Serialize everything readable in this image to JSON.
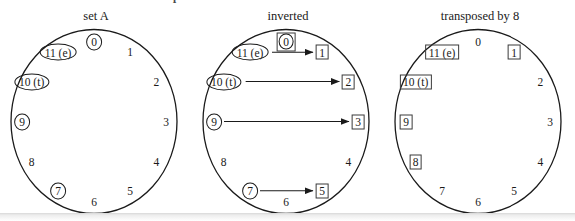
{
  "clipped_caption": "FIGURE 1.6. Pitch-class sets and operations",
  "colors": {
    "stroke": "#1a1a1a",
    "box_stroke": "#3a3a3a",
    "background": "#ffffff",
    "page_edge": "#e4e4e4"
  },
  "chart_data": {
    "type": "diagram",
    "title": "",
    "panels": [
      {
        "id": "set-a",
        "title": "set A",
        "clock_positions": [
          {
            "pc": 0,
            "label": "0",
            "angle_deg": 0,
            "marker": "ellipse"
          },
          {
            "pc": 1,
            "label": "1",
            "angle_deg": 30,
            "marker": "none"
          },
          {
            "pc": 2,
            "label": "2",
            "angle_deg": 60,
            "marker": "none"
          },
          {
            "pc": 3,
            "label": "3",
            "angle_deg": 90,
            "marker": "none"
          },
          {
            "pc": 4,
            "label": "4",
            "angle_deg": 120,
            "marker": "none"
          },
          {
            "pc": 5,
            "label": "5",
            "angle_deg": 150,
            "marker": "none"
          },
          {
            "pc": 6,
            "label": "6",
            "angle_deg": 180,
            "marker": "none"
          },
          {
            "pc": 7,
            "label": "7",
            "angle_deg": 210,
            "marker": "ellipse"
          },
          {
            "pc": 8,
            "label": "8",
            "angle_deg": 240,
            "marker": "none"
          },
          {
            "pc": 9,
            "label": "9",
            "angle_deg": 270,
            "marker": "ellipse"
          },
          {
            "pc": 10,
            "label": "10 (t)",
            "angle_deg": 300,
            "marker": "ellipse"
          },
          {
            "pc": 11,
            "label": "11 (e)",
            "angle_deg": 330,
            "marker": "ellipse"
          }
        ],
        "arrows": []
      },
      {
        "id": "inverted",
        "title": "inverted",
        "clock_positions": [
          {
            "pc": 0,
            "label": "0",
            "angle_deg": 0,
            "marker": "ellipse-in-box"
          },
          {
            "pc": 1,
            "label": "1",
            "angle_deg": 30,
            "marker": "box"
          },
          {
            "pc": 2,
            "label": "2",
            "angle_deg": 60,
            "marker": "box"
          },
          {
            "pc": 3,
            "label": "3",
            "angle_deg": 90,
            "marker": "box"
          },
          {
            "pc": 4,
            "label": "4",
            "angle_deg": 120,
            "marker": "none"
          },
          {
            "pc": 5,
            "label": "5",
            "angle_deg": 150,
            "marker": "box"
          },
          {
            "pc": 6,
            "label": "6",
            "angle_deg": 180,
            "marker": "none"
          },
          {
            "pc": 7,
            "label": "7",
            "angle_deg": 210,
            "marker": "ellipse"
          },
          {
            "pc": 8,
            "label": "8",
            "angle_deg": 240,
            "marker": "none"
          },
          {
            "pc": 9,
            "label": "9",
            "angle_deg": 270,
            "marker": "ellipse"
          },
          {
            "pc": 10,
            "label": "10 (t)",
            "angle_deg": 300,
            "marker": "ellipse"
          },
          {
            "pc": 11,
            "label": "11 (e)",
            "angle_deg": 330,
            "marker": "ellipse"
          }
        ],
        "arrows": [
          {
            "from_pc": 11,
            "to_pc": 1
          },
          {
            "from_pc": 10,
            "to_pc": 2
          },
          {
            "from_pc": 9,
            "to_pc": 3
          },
          {
            "from_pc": 7,
            "to_pc": 5
          }
        ]
      },
      {
        "id": "transposed-by-8",
        "title": "transposed by 8",
        "clock_positions": [
          {
            "pc": 0,
            "label": "0",
            "angle_deg": 0,
            "marker": "none"
          },
          {
            "pc": 1,
            "label": "1",
            "angle_deg": 30,
            "marker": "box"
          },
          {
            "pc": 2,
            "label": "2",
            "angle_deg": 60,
            "marker": "none"
          },
          {
            "pc": 3,
            "label": "3",
            "angle_deg": 90,
            "marker": "none"
          },
          {
            "pc": 4,
            "label": "4",
            "angle_deg": 120,
            "marker": "none"
          },
          {
            "pc": 5,
            "label": "5",
            "angle_deg": 150,
            "marker": "none"
          },
          {
            "pc": 6,
            "label": "6",
            "angle_deg": 180,
            "marker": "none"
          },
          {
            "pc": 7,
            "label": "7",
            "angle_deg": 210,
            "marker": "none"
          },
          {
            "pc": 8,
            "label": "8",
            "angle_deg": 240,
            "marker": "box"
          },
          {
            "pc": 9,
            "label": "9",
            "angle_deg": 270,
            "marker": "box"
          },
          {
            "pc": 10,
            "label": "10 (t)",
            "angle_deg": 300,
            "marker": "box"
          },
          {
            "pc": 11,
            "label": "11 (e)",
            "angle_deg": 330,
            "marker": "box"
          }
        ],
        "arrows": []
      }
    ]
  }
}
